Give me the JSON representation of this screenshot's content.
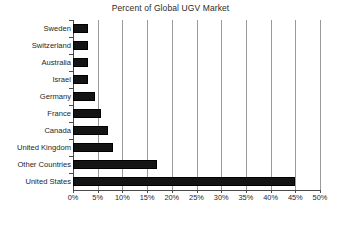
{
  "chart_data": {
    "type": "bar",
    "orientation": "horizontal",
    "title": "Percent of Global UGV Market",
    "xlabel": "",
    "ylabel": "",
    "categories": [
      "Sweden",
      "Switzerland",
      "Australia",
      "Israel",
      "Germany",
      "France",
      "Canada",
      "United Kingdom",
      "Other Countries",
      "United States"
    ],
    "values": [
      3,
      3,
      3,
      3,
      4.5,
      5.7,
      7,
      8,
      17,
      45
    ],
    "value_unit": "%",
    "xlim": [
      0,
      50
    ],
    "xticks": [
      0,
      5,
      10,
      15,
      20,
      25,
      30,
      35,
      40,
      45,
      50
    ],
    "xtick_labels": [
      "0%",
      "5%",
      "10%",
      "15%",
      "20%",
      "25%",
      "30%",
      "35%",
      "40%",
      "45%",
      "50%"
    ],
    "grid": "vertical",
    "legend": "none",
    "bar_color": "#141414",
    "grid_color": "#9a9a9a",
    "axis_color": "#4a4a4a",
    "text_color": "#1f1f1f"
  }
}
